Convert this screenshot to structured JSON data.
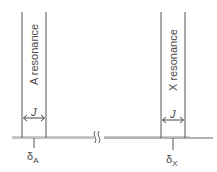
{
  "diagram": {
    "type": "NMR spectrum schematic (AX system, first-order)",
    "resonances": [
      {
        "id": "A",
        "label": "A resonance",
        "coupling_label": "J",
        "shift_symbol": "δ",
        "shift_subscript": "A"
      },
      {
        "id": "X",
        "label": "X resonance",
        "coupling_label": "J",
        "shift_symbol": "δ",
        "shift_subscript": "X"
      }
    ],
    "axis_break_symbol": "≀≀",
    "colors": {
      "line": "#555555",
      "baseline": "#777777",
      "text": "#4a4a4a",
      "background": "#ffffff"
    }
  }
}
